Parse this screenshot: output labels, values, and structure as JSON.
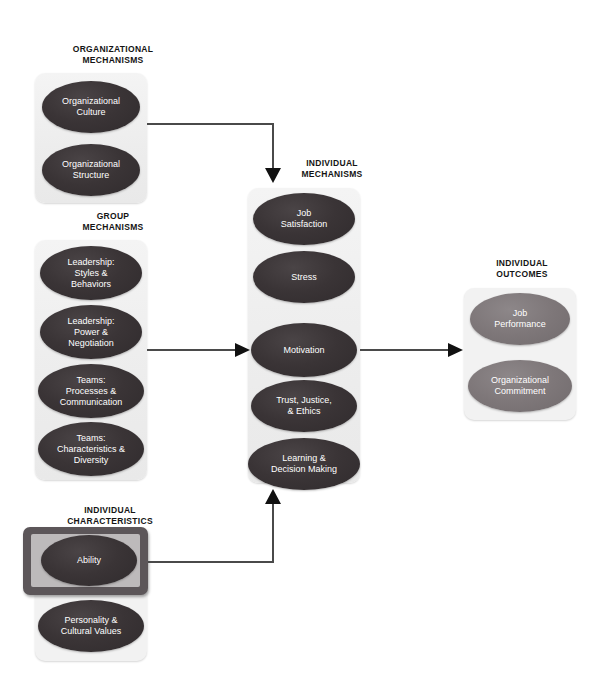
{
  "diagram": {
    "sections": [
      {
        "id": "organizational-mechanisms",
        "caption": "ORGANIZATIONAL\nMECHANISMS",
        "nodes": [
          {
            "id": "organizational-culture",
            "label": "Organizational\nCulture",
            "style": "dark"
          },
          {
            "id": "organizational-structure",
            "label": "Organizational\nStructure",
            "style": "dark"
          }
        ]
      },
      {
        "id": "group-mechanisms",
        "caption": "GROUP\nMECHANISMS",
        "nodes": [
          {
            "id": "leadership-styles-behaviors",
            "label": "Leadership:\nStyles &\nBehaviors",
            "style": "dark"
          },
          {
            "id": "leadership-power-negotiation",
            "label": "Leadership:\nPower &\nNegotiation",
            "style": "dark"
          },
          {
            "id": "teams-processes-communication",
            "label": "Teams:\nProcesses &\nCommunication",
            "style": "dark"
          },
          {
            "id": "teams-characteristics-diversity",
            "label": "Teams:\nCharacteristics &\nDiversity",
            "style": "dark"
          }
        ]
      },
      {
        "id": "individual-characteristics",
        "caption": "INDIVIDUAL\nCHARACTERISTICS",
        "nodes": [
          {
            "id": "ability",
            "label": "Ability",
            "style": "dark",
            "highlighted": true
          },
          {
            "id": "personality-cultural-values",
            "label": "Personality  &\nCultural Values",
            "style": "dark"
          }
        ]
      },
      {
        "id": "individual-mechanisms",
        "caption": "INDIVIDUAL\nMECHANISMS",
        "nodes": [
          {
            "id": "job-satisfaction",
            "label": "Job\nSatisfaction",
            "style": "dark"
          },
          {
            "id": "stress",
            "label": "Stress",
            "style": "dark"
          },
          {
            "id": "motivation",
            "label": "Motivation",
            "style": "dark"
          },
          {
            "id": "trust-justice-ethics",
            "label": "Trust, Justice,\n& Ethics",
            "style": "dark"
          },
          {
            "id": "learning-decision-making",
            "label": "Learning &\nDecision Making",
            "style": "dark"
          }
        ]
      },
      {
        "id": "individual-outcomes",
        "caption": "INDIVIDUAL\nOUTCOMES",
        "nodes": [
          {
            "id": "job-performance",
            "label": "Job\nPerformance",
            "style": "mid"
          },
          {
            "id": "organizational-commitment",
            "label": "Organizational\nCommitment",
            "style": "mid"
          }
        ]
      }
    ],
    "connectors": [
      {
        "id": "culture-to-individual-mechanisms",
        "from": "organizational-culture",
        "to": "individual-mechanisms",
        "direction": "down"
      },
      {
        "id": "group-to-individual-mechanisms",
        "from": "group-mechanisms",
        "to": "individual-mechanisms",
        "direction": "right"
      },
      {
        "id": "ability-to-individual-mechanisms",
        "from": "ability",
        "to": "individual-mechanisms",
        "direction": "up"
      },
      {
        "id": "individual-mechanisms-to-outcomes",
        "from": "individual-mechanisms",
        "to": "individual-outcomes",
        "direction": "right"
      }
    ],
    "colors": {
      "node_dark": "#3a3436",
      "node_mid": "#7e7779",
      "panel": "#f2f2f2",
      "highlight_frame": "#5c5659",
      "highlight_inner": "#bdbabb",
      "connector": "#4a4a4a",
      "arrow": "#111111",
      "caption_text": "#141414",
      "node_text": "#ffffff"
    }
  }
}
